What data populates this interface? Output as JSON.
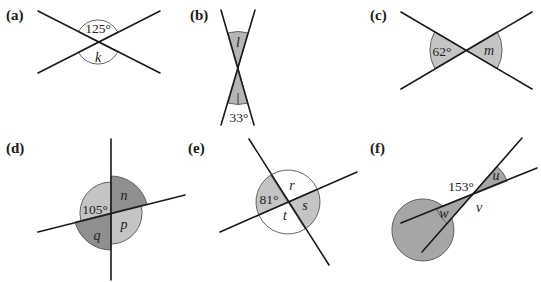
{
  "colors": {
    "line": "#1a1a1a",
    "arc_stroke": "#555555",
    "light_shade": "#c4c4c4",
    "dark_shade": "#8f8f8f",
    "medium_shade": "#a6a6a6",
    "unshaded": "#ffffff"
  },
  "panels": [
    {
      "id": "a",
      "label": "(a)",
      "angles": [
        {
          "position": "top",
          "text": "125°",
          "known": true,
          "shaded": false
        },
        {
          "position": "bottom",
          "text": "k",
          "known": false,
          "shaded": false
        }
      ]
    },
    {
      "id": "b",
      "label": "(b)",
      "angles": [
        {
          "position": "top",
          "text": "l",
          "known": false,
          "shaded": true
        },
        {
          "position": "bottom",
          "text": "33°",
          "known": true,
          "shaded": true
        }
      ]
    },
    {
      "id": "c",
      "label": "(c)",
      "angles": [
        {
          "position": "left",
          "text": "62°",
          "known": true,
          "shaded": true
        },
        {
          "position": "right",
          "text": "m",
          "known": false,
          "shaded": true
        }
      ]
    },
    {
      "id": "d",
      "label": "(d)",
      "angles": [
        {
          "position": "top-left",
          "text": "105°",
          "known": true,
          "shade": "light"
        },
        {
          "position": "top-right",
          "text": "n",
          "known": false,
          "shade": "dark"
        },
        {
          "position": "bottom-right",
          "text": "p",
          "known": false,
          "shade": "light"
        },
        {
          "position": "bottom-left",
          "text": "q",
          "known": false,
          "shade": "dark"
        }
      ]
    },
    {
      "id": "e",
      "label": "(e)",
      "angles": [
        {
          "position": "left",
          "text": "81°",
          "known": true,
          "shade": "light"
        },
        {
          "position": "top",
          "text": "r",
          "known": false,
          "shade": "none"
        },
        {
          "position": "right",
          "text": "s",
          "known": false,
          "shade": "light"
        },
        {
          "position": "bottom",
          "text": "t",
          "known": false,
          "shade": "none"
        }
      ]
    },
    {
      "id": "f",
      "label": "(f)",
      "angles": [
        {
          "position": "top-left",
          "text": "153°",
          "known": true,
          "shade": "medium"
        },
        {
          "position": "upper-right",
          "text": "u",
          "known": false,
          "shade": "medium"
        },
        {
          "position": "bottom-right",
          "text": "v",
          "known": false,
          "shade": "medium"
        },
        {
          "position": "lower-left",
          "text": "w",
          "known": false,
          "shade": "medium"
        }
      ]
    }
  ]
}
